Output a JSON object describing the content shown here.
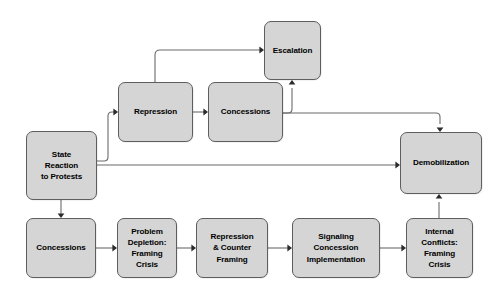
{
  "diagram": {
    "background_color": "#ffffff",
    "node_fill_color": "#d5d5d5",
    "node_border_color": "#5e5e5e",
    "edge_color": "#6b6b6b",
    "text_color": "#000000",
    "nodes": [
      {
        "id": "escalation",
        "label": "Escalation",
        "x": 264,
        "y": 21,
        "w": 57,
        "h": 59
      },
      {
        "id": "repression",
        "label": "Repression",
        "x": 118,
        "y": 82,
        "w": 75,
        "h": 60
      },
      {
        "id": "concessions_top",
        "label": "Concessions",
        "x": 208,
        "y": 82,
        "w": 75,
        "h": 60
      },
      {
        "id": "state_reaction",
        "label": "State\nReaction\nto Protests",
        "x": 26,
        "y": 131,
        "w": 71,
        "h": 69
      },
      {
        "id": "demobilization",
        "label": "Demobilization",
        "x": 400,
        "y": 132,
        "w": 82,
        "h": 62
      },
      {
        "id": "concessions_bottom",
        "label": "Concessions",
        "x": 26,
        "y": 218,
        "w": 70,
        "h": 60
      },
      {
        "id": "problem_depletion",
        "label": "Problem\nDepletion:\nFraming\nCrisis",
        "x": 117,
        "y": 218,
        "w": 60,
        "h": 60
      },
      {
        "id": "repression_counter_framing",
        "label": "Repression\n& Counter\nFraming",
        "x": 196,
        "y": 218,
        "w": 72,
        "h": 60
      },
      {
        "id": "signaling_concession",
        "label": "Signaling\nConcession\nImplementation",
        "x": 292,
        "y": 218,
        "w": 88,
        "h": 60
      },
      {
        "id": "internal_conflicts",
        "label": "Internal\nConflicts:\nFraming\nCrisis",
        "x": 406,
        "y": 218,
        "w": 67,
        "h": 60
      }
    ],
    "edges": [
      {
        "id": "state-to-repression",
        "from": "state_reaction",
        "to": "repression",
        "path": "M 97,161 L 104,161 Q 108,161 108,157 L 108,116 Q 108,112 112,112 L 114,112",
        "arrow_at": [
          118,
          112
        ],
        "arrow_dir": "right"
      },
      {
        "id": "state-to-demobilization",
        "from": "state_reaction",
        "to": "demobilization",
        "path": "M 97,165 L 396,165",
        "arrow_at": [
          400,
          165
        ],
        "arrow_dir": "right"
      },
      {
        "id": "state-to-concessions-bottom",
        "from": "state_reaction",
        "to": "concessions_bottom",
        "path": "M 61,200 L 61,214",
        "arrow_at": [
          61,
          218
        ],
        "arrow_dir": "down"
      },
      {
        "id": "repression-to-concessions-top",
        "from": "repression",
        "to": "concessions_top",
        "path": "M 193,112 L 204,112",
        "arrow_at": [
          208,
          112
        ],
        "arrow_dir": "right"
      },
      {
        "id": "repression-to-escalation",
        "from": "repression",
        "to": "escalation",
        "path": "M 155,82 L 155,55 Q 155,50 160,50 L 260,50",
        "arrow_at": [
          264,
          50
        ],
        "arrow_dir": "right"
      },
      {
        "id": "concessions-top-to-escalation",
        "from": "concessions_top",
        "to": "escalation",
        "path": "M 283,113 L 288,113 Q 292,113 292,109 L 292,88",
        "arrow_at": [
          292,
          80
        ],
        "arrow_dir": "up"
      },
      {
        "id": "concessions-top-to-demobilization",
        "from": "concessions_top",
        "to": "demobilization",
        "path": "M 283,113 L 436,113 Q 440,113 440,117 L 440,124",
        "arrow_at": [
          440,
          132
        ],
        "arrow_dir": "down"
      },
      {
        "id": "concessions-bottom-to-problem-depletion",
        "from": "concessions_bottom",
        "to": "problem_depletion",
        "path": "M 96,248 L 113,248",
        "arrow_at": [
          117,
          248
        ],
        "arrow_dir": "right"
      },
      {
        "id": "problem-depletion-to-repression-counter",
        "from": "problem_depletion",
        "to": "repression_counter_framing",
        "path": "M 177,248 L 192,248",
        "arrow_at": [
          196,
          248
        ],
        "arrow_dir": "right"
      },
      {
        "id": "repression-counter-to-signaling",
        "from": "repression_counter_framing",
        "to": "signaling_concession",
        "path": "M 268,248 L 288,248",
        "arrow_at": [
          292,
          248
        ],
        "arrow_dir": "right"
      },
      {
        "id": "signaling-to-internal-conflicts",
        "from": "signaling_concession",
        "to": "internal_conflicts",
        "path": "M 380,248 L 402,248",
        "arrow_at": [
          406,
          248
        ],
        "arrow_dir": "right"
      },
      {
        "id": "internal-conflicts-to-demobilization",
        "from": "internal_conflicts",
        "to": "demobilization",
        "path": "M 439,218 L 439,202",
        "arrow_at": [
          439,
          194
        ],
        "arrow_dir": "up"
      }
    ]
  }
}
